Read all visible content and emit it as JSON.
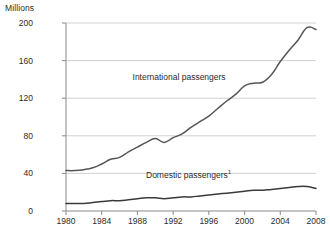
{
  "chart_data": {
    "type": "line",
    "title": "",
    "subtitle": "",
    "ylabel": "Millions",
    "xlabel": "",
    "ylim": [
      0,
      200
    ],
    "xlim": [
      1980,
      2008
    ],
    "yticks": [
      0,
      40,
      80,
      120,
      160,
      200
    ],
    "xticks": [
      1980,
      1984,
      1988,
      1992,
      1996,
      2000,
      2004,
      2008
    ],
    "grid": true,
    "grid_axis": "y",
    "legend_position": "inline-annotation",
    "x": [
      1980,
      1981,
      1982,
      1983,
      1984,
      1985,
      1986,
      1987,
      1988,
      1989,
      1990,
      1991,
      1992,
      1993,
      1994,
      1995,
      1996,
      1997,
      1998,
      1999,
      2000,
      2001,
      2002,
      2003,
      2004,
      2005,
      2006,
      2007,
      2008
    ],
    "series": [
      {
        "name": "International passengers",
        "color": "#555555",
        "values": [
          43,
          43,
          44,
          46,
          50,
          55,
          57,
          63,
          68,
          73,
          77,
          73,
          78,
          82,
          89,
          95,
          101,
          109,
          117,
          124,
          133,
          136,
          137,
          145,
          159,
          171,
          182,
          195,
          193
        ]
      },
      {
        "name": "Domestic passengers",
        "color": "#3a3a3a",
        "footnote_marker": "1",
        "values": [
          8,
          8,
          8,
          9,
          10,
          11,
          11,
          12,
          13,
          14,
          14,
          13,
          14,
          15,
          15,
          16,
          17,
          18,
          19,
          20,
          21,
          22,
          22,
          23,
          24,
          25,
          26,
          26,
          24
        ]
      }
    ],
    "annotations": [
      {
        "text": "International passengers",
        "x": 1993.5,
        "y": 142
      },
      {
        "text": "Domestic passengers",
        "footnote": "1",
        "x": 1994.0,
        "y": 38
      }
    ]
  },
  "axes": {
    "y_unit_label": "Millions"
  }
}
